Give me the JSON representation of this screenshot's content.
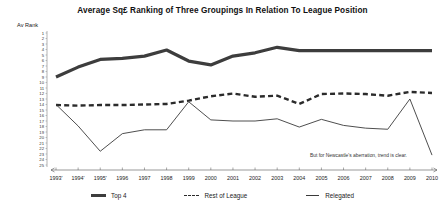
{
  "chart_data": {
    "type": "line",
    "title": "Average Sq£ Ranking of Three Groupings In Relation To League Position",
    "ylabel": "Av Rank",
    "xlabel": "",
    "ylim": [
      1,
      25
    ],
    "y_inverted": true,
    "grid": false,
    "legend_position": "bottom",
    "ytick_labels": [
      "1",
      "2",
      "3",
      "4",
      "5",
      "6",
      "7",
      "8",
      "9",
      "10",
      "11",
      "12",
      "13",
      "14",
      "15",
      "16",
      "17",
      "18",
      "19",
      "20",
      "21",
      "22",
      "23",
      "24",
      "25"
    ],
    "categories": [
      "1993'",
      "1994'",
      "1995'",
      "1996",
      "1997",
      "1998",
      "1999",
      "2000",
      "2001",
      "2002",
      "2003",
      "2004",
      "2005",
      "2006",
      "2007",
      "2008",
      "2009",
      "2010"
    ],
    "series": [
      {
        "name": "Top 4",
        "style": "solid-thick",
        "color": "#3d3d3d",
        "values": [
          9,
          7.2,
          5.8,
          5.6,
          5.2,
          4.1,
          6.1,
          6.8,
          5.2,
          4.6,
          3.6,
          4.2,
          4.2,
          4.2,
          4.2,
          4.2,
          4.2,
          4.2
        ]
      },
      {
        "name": "Rest of League",
        "style": "dashed",
        "color": "#2b2b2b",
        "values": [
          14.1,
          14.2,
          14.1,
          14.1,
          14.0,
          13.9,
          13.3,
          12.5,
          12.0,
          12.6,
          12.4,
          13.9,
          12.1,
          12.0,
          12.1,
          12.4,
          11.7,
          11.9
        ]
      },
      {
        "name": "Relegated",
        "style": "solid-thin",
        "color": "#3a3a3a",
        "values": [
          14.0,
          17.9,
          22.5,
          19.3,
          18.6,
          18.6,
          13.5,
          16.8,
          17.0,
          17.0,
          16.6,
          18.1,
          16.7,
          17.8,
          18.3,
          18.5,
          13.0,
          23.2
        ]
      }
    ],
    "annotations": [
      {
        "text": "But for Newcastle's aberration, trend is clear.",
        "x": 310,
        "y": 153
      }
    ]
  }
}
